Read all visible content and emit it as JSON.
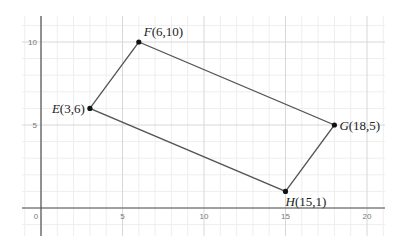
{
  "chart_data": {
    "type": "scatter",
    "title": "",
    "xlabel": "",
    "ylabel": "",
    "xlim": [
      -1,
      22
    ],
    "ylim": [
      -2,
      12
    ],
    "grid": true,
    "x_ticks": [
      0,
      5,
      10,
      15,
      20
    ],
    "y_ticks": [
      5,
      10
    ],
    "points": [
      {
        "name": "E",
        "x": 3,
        "y": 6,
        "label": "(3,6)"
      },
      {
        "name": "F",
        "x": 6,
        "y": 10,
        "label": "(6,10)"
      },
      {
        "name": "G",
        "x": 18,
        "y": 5,
        "label": "(18,5)"
      },
      {
        "name": "H",
        "x": 15,
        "y": 1,
        "label": "(15,1)"
      }
    ],
    "polygon": [
      "E",
      "F",
      "G",
      "H"
    ]
  },
  "colors": {
    "grid_minor": "#eeeeee",
    "grid_major": "#d8d8d8",
    "axis": "#555555",
    "shape": "#555555",
    "point": "#111111"
  }
}
